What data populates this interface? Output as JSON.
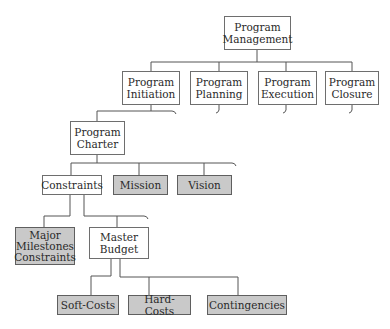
{
  "diagram": {
    "type": "hierarchy",
    "colors": {
      "plain_fill": "#ffffff",
      "shaded_fill": "#c9c9c9",
      "line": "#555555"
    },
    "nodes": [
      {
        "id": "program-management",
        "label": "Program\nManagement",
        "shaded": false
      },
      {
        "id": "program-initiation",
        "label": "Program\nInitiation",
        "shaded": false
      },
      {
        "id": "program-planning",
        "label": "Program\nPlanning",
        "shaded": false
      },
      {
        "id": "program-execution",
        "label": "Program\nExecution",
        "shaded": false
      },
      {
        "id": "program-closure",
        "label": "Program\nClosure",
        "shaded": false
      },
      {
        "id": "program-charter",
        "label": "Program\nCharter",
        "shaded": false
      },
      {
        "id": "constraints",
        "label": "Constraints",
        "shaded": false
      },
      {
        "id": "mission",
        "label": "Mission",
        "shaded": true
      },
      {
        "id": "vision",
        "label": "Vision",
        "shaded": true
      },
      {
        "id": "major-milestones-constraints",
        "label": "Major\nMilestones\nConstraints",
        "shaded": true
      },
      {
        "id": "master-budget",
        "label": "Master\nBudget",
        "shaded": false
      },
      {
        "id": "soft-costs",
        "label": "Soft-Costs",
        "shaded": true
      },
      {
        "id": "hard-costs",
        "label": "Hard-Costs",
        "shaded": true
      },
      {
        "id": "contingencies",
        "label": "Contingencies",
        "shaded": true
      }
    ],
    "edges": [
      [
        "program-management",
        "program-initiation"
      ],
      [
        "program-management",
        "program-planning"
      ],
      [
        "program-management",
        "program-execution"
      ],
      [
        "program-management",
        "program-closure"
      ],
      [
        "program-initiation",
        "program-charter"
      ],
      [
        "program-charter",
        "constraints"
      ],
      [
        "program-charter",
        "mission"
      ],
      [
        "program-charter",
        "vision"
      ],
      [
        "constraints",
        "major-milestones-constraints"
      ],
      [
        "constraints",
        "master-budget"
      ],
      [
        "master-budget",
        "soft-costs"
      ],
      [
        "master-budget",
        "hard-costs"
      ],
      [
        "master-budget",
        "contingencies"
      ]
    ]
  }
}
